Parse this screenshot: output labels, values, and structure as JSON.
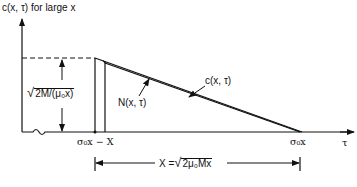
{
  "title": "c(x, τ) for large x",
  "axes": {
    "x_label": "τ",
    "y_label": "c(x, τ) for large x"
  },
  "curves": {
    "upper": "c(x, τ)",
    "lower": "N(x, τ)"
  },
  "tick_labels": {
    "left": "σ₀x − X",
    "right": "σ₀x"
  },
  "height_dimension": {
    "radicand": "2M/(μ₀x)"
  },
  "width_dimension": {
    "lhs": "X =",
    "radicand": "2μ₀Mx"
  },
  "colors": {
    "ink": "#111111",
    "background": "#ffffff"
  }
}
